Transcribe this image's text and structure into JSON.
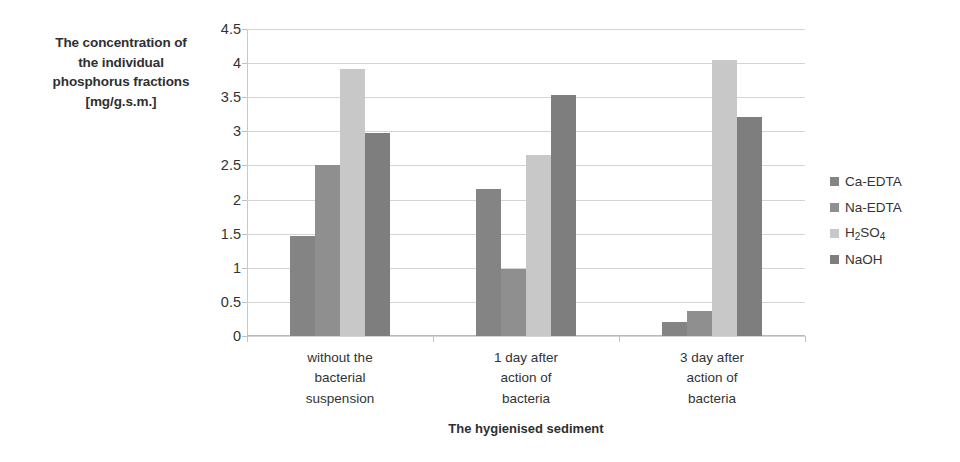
{
  "chart_data": {
    "type": "bar",
    "title": "",
    "xlabel": "The hygienised sediment",
    "ylabel": "The concentration of the individual phosphorus fractions [mg/g.s.m.]",
    "ylim": [
      0,
      4.5
    ],
    "ytick_labels": [
      "4.5",
      "4",
      "3.5",
      "3",
      "2.5",
      "2",
      "1.5",
      "1",
      "0.5",
      "0"
    ],
    "ytick_values": [
      4.5,
      4,
      3.5,
      3,
      2.5,
      2,
      1.5,
      1,
      0.5,
      0
    ],
    "grid": true,
    "legend_position": "right",
    "categories": [
      "without the\nbacterial\nsuspension",
      "1 day after\naction of\nbacteria",
      "3 day after\naction of\nbacteria"
    ],
    "category_lines": [
      [
        "without the",
        "bacterial",
        "suspension"
      ],
      [
        "1 day after",
        "action of",
        "bacteria"
      ],
      [
        "3 day after",
        "action of",
        "bacteria"
      ]
    ],
    "series": [
      {
        "name": "Ca-EDTA",
        "color": "#848484",
        "values": [
          1.47,
          2.16,
          0.21
        ]
      },
      {
        "name": "Na-EDTA",
        "color": "#8f8f8f",
        "values": [
          2.5,
          0.98,
          0.36
        ]
      },
      {
        "name": "H2SO4",
        "color": "#c8c8c8",
        "values": [
          3.91,
          2.66,
          4.04
        ]
      },
      {
        "name": "NaOH",
        "color": "#7e7e7e",
        "values": [
          2.97,
          3.53,
          3.21
        ]
      }
    ],
    "legend_entries": [
      {
        "label": "Ca-EDTA",
        "color": "#848484"
      },
      {
        "label": "Na-EDTA",
        "color": "#8f8f8f"
      },
      {
        "label": "H2SO4",
        "color": "#c8c8c8",
        "html": "H<sub>2</sub>SO<sub>4</sub>"
      },
      {
        "label": "NaOH",
        "color": "#7e7e7e"
      }
    ]
  },
  "axis_titles": {
    "y_lines": [
      "The concentration of",
      "the individual",
      "phosphorus fractions",
      "[mg/g.s.m.]"
    ],
    "x": "The hygienised sediment"
  },
  "colors": {
    "gridline": "#d4d4d4",
    "axis": "#bfbfbf",
    "text": "#333333",
    "background": "#ffffff"
  }
}
